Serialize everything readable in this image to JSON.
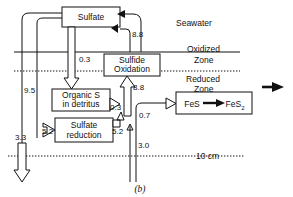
{
  "figure": {
    "panel_label": "(b)",
    "depth_marker": "10 cm"
  },
  "zones": {
    "seawater": "Seawater",
    "oxidized_line1": "Oxidized",
    "oxidized_line2": "Zone",
    "reduced_line1": "Reduced",
    "reduced_line2": "Zone"
  },
  "boxes": {
    "sulfate": "Sulfate",
    "sulfide_oxidation_line1": "Sulfide",
    "sulfide_oxidation_line2": "Oxidation",
    "organic_s_line1": "Organic S",
    "organic_s_line2": "in detritus",
    "sulfate_reduction_line1": "Sulfate",
    "sulfate_reduction_line2": "reduction",
    "pyrite_from": "FeS",
    "pyrite_to": "FeS",
    "pyrite_to_sub": "2"
  },
  "fluxes": {
    "sulfate_to_oxidation": "8.8",
    "sulfate_to_organic": "0.3",
    "deep_sulfate_return": "9.5",
    "sulfide_to_oxidation": "8.8",
    "organic_to_right": "0.3",
    "sulfate_reduction_in": "5.2",
    "sulfate_reduction_out": "5.2",
    "fes_input": "0.7",
    "burial_left": "3.3",
    "burial_right": "3.0"
  },
  "colors": {
    "line": "#111111",
    "fill": "#ffffff"
  }
}
